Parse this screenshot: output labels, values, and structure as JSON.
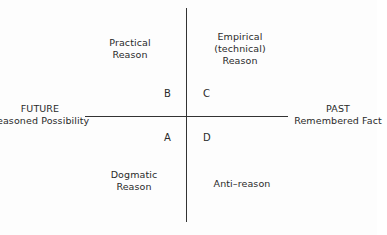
{
  "axes": {
    "left": {
      "title": "FUTURE",
      "subtitle": "Reasoned Possibility"
    },
    "right": {
      "title": "PAST",
      "subtitle": "Remembered Fact"
    }
  },
  "quadrants": {
    "B": {
      "letter": "B",
      "lines": [
        "Practical",
        "Reason"
      ]
    },
    "C": {
      "letter": "C",
      "lines": [
        "Empirical",
        "(technical)",
        "Reason"
      ]
    },
    "A": {
      "letter": "A",
      "lines": [
        "Dogmatic",
        "Reason"
      ]
    },
    "D": {
      "letter": "D",
      "lines": [
        "Anti–reason"
      ]
    }
  }
}
